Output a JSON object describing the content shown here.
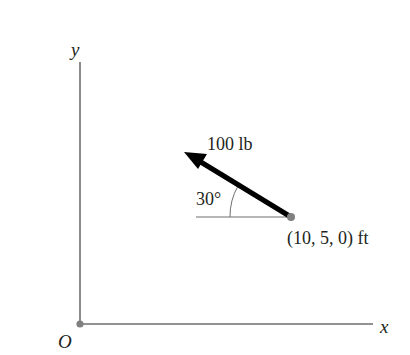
{
  "diagram": {
    "type": "force-vector-2d",
    "axes": {
      "x_label": "x",
      "y_label": "y",
      "origin_label": "O"
    },
    "force": {
      "magnitude_label": "100 lb",
      "angle_label": "30°",
      "point_label": "(10, 5, 0) ft"
    },
    "colors": {
      "axis": "#6d6e70",
      "arrow": "#000000",
      "point": "#808080",
      "text": "#231f20",
      "reference_line": "#6d6e70"
    }
  }
}
